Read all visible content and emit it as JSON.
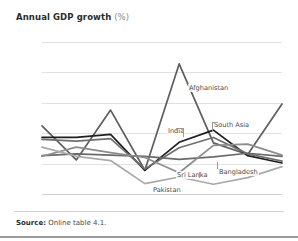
{
  "figure": {
    "title_main": "Annual GDP growth",
    "title_unit": "(%)",
    "source_label": "Source:",
    "source_text": "Online table 4.1."
  },
  "chart_data": {
    "type": "line",
    "title": "Annual GDP growth (%)",
    "xlabel": "",
    "ylabel": "",
    "x": [
      2005,
      2006,
      2007,
      2008,
      2009,
      2010,
      2011,
      2012
    ],
    "xtick_labels": [
      "2005",
      "2006",
      "2007",
      "2008",
      "2009",
      "2010",
      "2011",
      "2012"
    ],
    "ytick_labels": [
      "0",
      "5",
      "10",
      "15",
      "20",
      "25"
    ],
    "yticks": [
      0,
      5,
      10,
      15,
      20,
      25
    ],
    "ylim": [
      0,
      25
    ],
    "grid": true,
    "legend": "inline-labels",
    "series": [
      {
        "name": "Afghanistan",
        "color": "#5e5e5e",
        "values": [
          11.2,
          5.6,
          13.8,
          3.9,
          21.4,
          8.4,
          6.5,
          14.8
        ],
        "label_x": 188,
        "label_y": 84
      },
      {
        "name": "India",
        "color": "#1f1f1f",
        "values": [
          9.3,
          9.3,
          9.8,
          3.9,
          8.5,
          10.5,
          6.3,
          5.1
        ],
        "label_x": 167,
        "label_y": 127
      },
      {
        "name": "South Asia",
        "color": "#6f6f6f",
        "values": [
          9.0,
          8.7,
          9.1,
          4.1,
          7.6,
          9.3,
          6.6,
          5.4
        ],
        "label_x": 213,
        "label_y": 121
      },
      {
        "name": "Bangladesh",
        "color": "#6a6a6a",
        "values": [
          6.3,
          6.6,
          6.4,
          6.2,
          5.7,
          6.1,
          6.7,
          6.2
        ],
        "label_x": 218,
        "label_y": 168
      },
      {
        "name": "Sri Lanka",
        "color": "#8c8c8c",
        "values": [
          6.2,
          7.7,
          6.8,
          6.0,
          3.5,
          8.0,
          8.2,
          6.4
        ],
        "label_x": 176,
        "label_y": 171
      },
      {
        "name": "Pakistan",
        "color": "#a9a9a9",
        "values": [
          7.7,
          6.2,
          5.5,
          1.7,
          2.8,
          1.6,
          2.7,
          4.5
        ],
        "label_x": 152,
        "label_y": 186
      }
    ]
  }
}
